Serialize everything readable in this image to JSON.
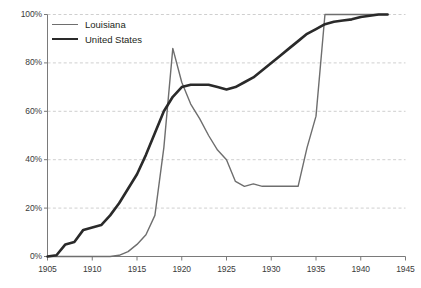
{
  "chart_data": {
    "type": "line",
    "title": "",
    "xlabel": "",
    "ylabel": "",
    "xlim": [
      1905,
      1945
    ],
    "ylim": [
      0,
      100
    ],
    "grid": true,
    "grid_orientation": "horizontal",
    "legend_position": "top-left",
    "x_ticks": [
      1905,
      1910,
      1915,
      1920,
      1925,
      1930,
      1935,
      1940,
      1945
    ],
    "x_tick_labels": [
      "1905",
      "1910",
      "1915",
      "1920",
      "1925",
      "1930",
      "1935",
      "1940",
      "1945"
    ],
    "y_ticks": [
      0,
      20,
      40,
      60,
      80,
      100
    ],
    "y_tick_labels": [
      "0%",
      "20%",
      "40%",
      "60%",
      "80%",
      "100%"
    ],
    "series": [
      {
        "name": "Louisiana",
        "color": "#6e6e6e",
        "width": 1.4,
        "x": [
          1905,
          1906,
          1907,
          1908,
          1909,
          1910,
          1911,
          1912,
          1913,
          1914,
          1915,
          1916,
          1917,
          1918,
          1919,
          1920,
          1921,
          1922,
          1923,
          1924,
          1925,
          1926,
          1927,
          1928,
          1929,
          1930,
          1931,
          1932,
          1933,
          1934,
          1935,
          1936,
          1937,
          1938,
          1939,
          1940,
          1941,
          1942,
          1943
        ],
        "values": [
          0,
          0,
          0,
          0,
          0,
          0,
          0,
          0,
          0.5,
          2,
          5,
          9,
          17,
          45,
          86,
          72,
          63,
          57,
          50,
          44,
          40,
          31,
          29,
          30,
          29,
          29,
          29,
          29,
          29,
          45,
          58,
          100,
          100,
          100,
          100,
          100,
          100,
          100,
          100
        ]
      },
      {
        "name": "United States",
        "color": "#2a2a2a",
        "width": 2.6,
        "x": [
          1905,
          1906,
          1907,
          1908,
          1909,
          1910,
          1911,
          1912,
          1913,
          1914,
          1915,
          1916,
          1917,
          1918,
          1919,
          1920,
          1921,
          1922,
          1923,
          1924,
          1925,
          1926,
          1927,
          1928,
          1929,
          1930,
          1931,
          1932,
          1933,
          1934,
          1935,
          1936,
          1937,
          1938,
          1939,
          1940,
          1941,
          1942,
          1943
        ],
        "values": [
          0,
          0.5,
          5,
          6,
          11,
          12,
          13,
          17,
          22,
          28,
          34,
          42,
          51,
          60,
          66,
          70,
          71,
          71,
          71,
          70,
          69,
          70,
          72,
          74,
          77,
          80,
          83,
          86,
          89,
          92,
          94,
          96,
          97,
          97.5,
          98,
          99,
          99.5,
          100,
          100
        ]
      }
    ]
  },
  "legend": {
    "items": [
      {
        "label": "Louisiana"
      },
      {
        "label": "United States"
      }
    ]
  },
  "axes": {
    "axis_color": "#7a7a7a",
    "grid_color": "#c9c9c9"
  }
}
